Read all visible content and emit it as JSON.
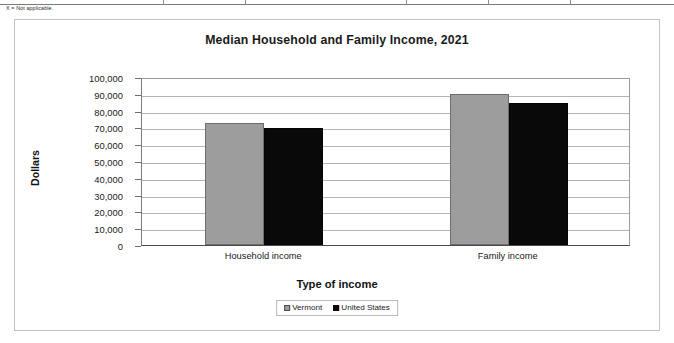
{
  "footnote": "X = Not applicable.",
  "chart_data": {
    "type": "bar",
    "title": "Median Household and Family Income, 2021",
    "xlabel": "Type of income",
    "ylabel": "Dollars",
    "categories": [
      "Household income",
      "Family income"
    ],
    "series": [
      {
        "name": "Vermont",
        "color": "#9d9d9d",
        "values": [
          72431,
          90000
        ]
      },
      {
        "name": "United States",
        "color": "#0a0a0a",
        "values": [
          69717,
          84500
        ]
      }
    ],
    "ylim": [
      0,
      100000
    ],
    "ytick_labels": [
      "100,000",
      "90,000",
      "80,000",
      "70,000",
      "60,000",
      "50,000",
      "40,000",
      "30,000",
      "20,000",
      "10,000",
      "0"
    ],
    "ytick_values": [
      100000,
      90000,
      80000,
      70000,
      60000,
      50000,
      40000,
      30000,
      20000,
      10000,
      0
    ],
    "ytick_step": 10000,
    "grid": true,
    "legend_position": "bottom",
    "legend_entries": [
      "Vermont",
      "United States"
    ]
  },
  "table_remnant": {
    "column_separator_positions": [
      163,
      245,
      406,
      488,
      570
    ]
  }
}
